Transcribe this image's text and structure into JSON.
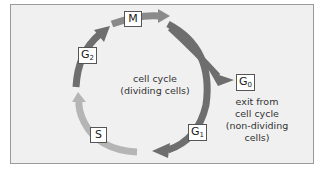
{
  "diagram": {
    "title": "cell cycle",
    "center_text": [
      "cell cycle",
      "(dividing cells)"
    ],
    "exit_text": [
      "exit from",
      "cell cycle",
      "(non-dividing",
      "cells)"
    ],
    "phases": [
      {
        "id": "M",
        "label": "M",
        "sub": ""
      },
      {
        "id": "G1",
        "label": "G",
        "sub": "1"
      },
      {
        "id": "S",
        "label": "S",
        "sub": ""
      },
      {
        "id": "G2",
        "label": "G",
        "sub": "2"
      },
      {
        "id": "G0",
        "label": "G",
        "sub": "0"
      }
    ],
    "colors": {
      "background": "#f0f0f0",
      "border": "#9a9a9a",
      "dark_arrow": "#6e6e6e",
      "light_arrow": "#b5b5b5",
      "label_border": "#555555"
    }
  }
}
